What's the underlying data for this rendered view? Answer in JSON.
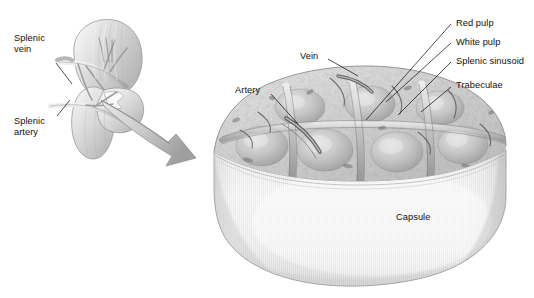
{
  "figure": {
    "background_color": "#ffffff",
    "style": "grayscale medical illustration"
  },
  "organ": {
    "name": "spleen",
    "description": "whole spleen with hilum vessels",
    "labels": [
      {
        "id": "splenic-vein",
        "text": "Splenic\nvein",
        "x": 14,
        "y": 36,
        "leader": {
          "x1": 56,
          "y1": 63,
          "x2": 72,
          "y2": 84
        }
      },
      {
        "id": "splenic-artery",
        "text": "Splenic\nartery",
        "x": 14,
        "y": 118,
        "leader": {
          "x1": 57,
          "y1": 116,
          "x2": 70,
          "y2": 100
        }
      }
    ]
  },
  "arrow": {
    "name": "magnification-arrow",
    "from": "spleen hilum",
    "to": "tissue block"
  },
  "block": {
    "name": "splenic tissue wedge",
    "nodule_count": 7,
    "labels": [
      {
        "id": "vein",
        "text": "Vein",
        "x": 300,
        "y": 52,
        "anchor": "left",
        "leader": {
          "x1": 328,
          "y1": 59,
          "x2": 356,
          "y2": 74
        }
      },
      {
        "id": "artery",
        "text": "Artery",
        "x": 235,
        "y": 86,
        "anchor": "left",
        "leader": {
          "x1": 271,
          "y1": 94,
          "x2": 296,
          "y2": 122
        }
      },
      {
        "id": "red-pulp",
        "text": "Red pulp",
        "x": 455,
        "y": 20,
        "anchor": "right",
        "leader": {
          "x1": 450,
          "y1": 24,
          "x2": 368,
          "y2": 118
        }
      },
      {
        "id": "white-pulp",
        "text": "White pulp",
        "x": 455,
        "y": 39,
        "anchor": "right",
        "leader": {
          "x1": 450,
          "y1": 43,
          "x2": 385,
          "y2": 100
        }
      },
      {
        "id": "splenic-sinusoid",
        "text": "Splenic sinusoid",
        "x": 455,
        "y": 58,
        "anchor": "right",
        "leader": {
          "x1": 450,
          "y1": 62,
          "x2": 397,
          "y2": 113
        }
      },
      {
        "id": "trabeculae",
        "text": "Trabeculae",
        "x": 455,
        "y": 78,
        "anchor": "right",
        "leader": {
          "x1": 450,
          "y1": 86,
          "x2": 420,
          "y2": 110
        }
      },
      {
        "id": "capsule",
        "text": "Capsule",
        "x": 396,
        "y": 214,
        "anchor": "none",
        "leader": null
      }
    ]
  },
  "colors": {
    "ink": "#100f0f",
    "leader": "#161616",
    "organ_light": "#f2f2f2",
    "organ_mid": "#cfcfcf",
    "organ_dark": "#9a9a9a",
    "capsule_light": "#f4f4f4",
    "capsule_mid": "#dedede",
    "capsule_dark": "#b4b4b4",
    "tissue_light": "#efefef",
    "tissue_mid": "#c2c2c2",
    "tissue_dark": "#8d8d8d",
    "outline": "#6e6e6e"
  }
}
